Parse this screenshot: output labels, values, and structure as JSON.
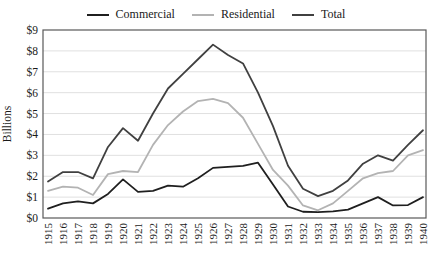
{
  "chart_data": {
    "type": "line",
    "title": "",
    "xlabel": "",
    "ylabel": "Billions",
    "ylim": [
      0,
      9
    ],
    "ytick_labels": [
      "$0",
      "$1",
      "$2",
      "$3",
      "$4",
      "$5",
      "$6",
      "$7",
      "$8",
      "$9"
    ],
    "grid": true,
    "legend_position": "top",
    "categories": [
      "1915",
      "1916",
      "1917",
      "1918",
      "1919",
      "1920",
      "1921",
      "1922",
      "1923",
      "1924",
      "1925",
      "1926",
      "1927",
      "1928",
      "1929",
      "1930",
      "1931",
      "1932",
      "1933",
      "1934",
      "1935",
      "1936",
      "1937",
      "1938",
      "1939",
      "1940"
    ],
    "series": [
      {
        "name": "Commercial",
        "color": "#1f1f1f",
        "values": [
          0.45,
          0.7,
          0.8,
          0.7,
          1.15,
          1.85,
          1.25,
          1.3,
          1.55,
          1.5,
          1.9,
          2.4,
          2.45,
          2.5,
          2.65,
          1.6,
          0.55,
          0.3,
          0.28,
          0.32,
          0.4,
          0.7,
          1.0,
          0.6,
          0.62,
          1.0
        ]
      },
      {
        "name": "Residential",
        "color": "#b3b3b3",
        "values": [
          1.3,
          1.5,
          1.45,
          1.1,
          2.1,
          2.25,
          2.2,
          3.5,
          4.45,
          5.1,
          5.6,
          5.7,
          5.5,
          4.8,
          3.55,
          2.3,
          1.55,
          0.6,
          0.37,
          0.7,
          1.3,
          1.9,
          2.15,
          2.25,
          3.0,
          3.25
        ]
      },
      {
        "name": "Total",
        "color": "#404040",
        "values": [
          1.75,
          2.2,
          2.2,
          1.9,
          3.4,
          4.3,
          3.7,
          5.0,
          6.2,
          6.9,
          7.6,
          8.3,
          7.8,
          7.4,
          6.0,
          4.4,
          2.5,
          1.4,
          1.05,
          1.3,
          1.8,
          2.6,
          3.0,
          2.75,
          3.5,
          4.2
        ]
      }
    ]
  },
  "colors": {
    "background": "#ffffff",
    "plot_border": "#595959",
    "gridline": "#e0e0e0",
    "text": "#1a1a1a"
  }
}
